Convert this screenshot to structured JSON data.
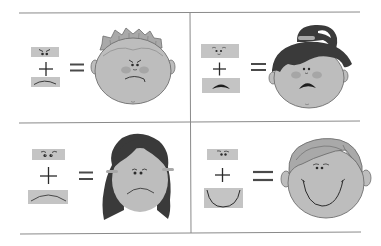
{
  "worksheet": {
    "topic": "emotion faces: eyes + mouth = face",
    "colors": {
      "background": "#ffffff",
      "grid_line": "#8a8a8a",
      "swatch": "#c4c4c4",
      "skin": "#bdbdbd",
      "skin_outline": "#6e6e6e",
      "hair_light": "#a9a9a9",
      "hair_dark": "#3a3a3a",
      "feature": "#2b2b2b",
      "cheek": "#a0a0a0"
    },
    "symbols": {
      "plus": "+",
      "equals": "="
    },
    "panels": [
      {
        "position": "top-left",
        "emotion": "angry",
        "eyes": "angry-brows",
        "mouth": "slight-frown",
        "face": "boy-spiky-hair"
      },
      {
        "position": "top-right",
        "emotion": "scared",
        "eyes": "raised-brows",
        "mouth": "open-frown",
        "face": "girl-ponytail"
      },
      {
        "position": "bottom-left",
        "emotion": "sad",
        "eyes": "worried-brows",
        "mouth": "frown",
        "face": "girl-long-hair"
      },
      {
        "position": "bottom-right",
        "emotion": "happy",
        "eyes": "relaxed-brows",
        "mouth": "big-smile",
        "face": "boy-wavy-hair"
      }
    ]
  }
}
